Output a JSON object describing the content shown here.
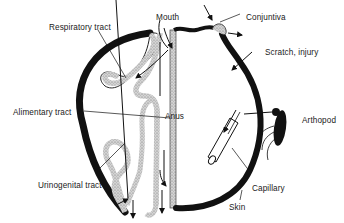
{
  "figure": {
    "colors": {
      "skin": "#111111",
      "mucosa_fill": "#cfcfcf",
      "mucosa_outline": "#222222",
      "background": "#ffffff"
    },
    "labels": {
      "respiratory": "Respiratory  tract",
      "mouth": "Mouth",
      "conjuntiva": "Conjuntiva",
      "scratch": "Scratch, injury",
      "alimentary": "Alimentary  tract",
      "anus": "Anus",
      "arthropod": "Arthopod",
      "urinogenital": "Urinogenital  tract",
      "capillary": "Capillary",
      "skin": "Skin"
    },
    "icons": [
      "arthropod-insect",
      "capillary-tube",
      "entry-arrow",
      "exit-arrow"
    ]
  }
}
